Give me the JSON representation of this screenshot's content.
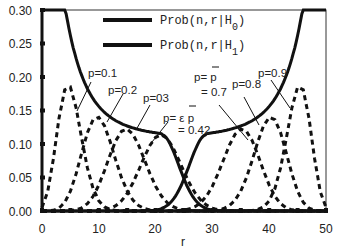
{
  "chart_data": {
    "type": "line",
    "title": "",
    "xlabel": "r",
    "ylabel": "",
    "xlim": [
      0,
      50
    ],
    "ylim": [
      0.0,
      0.3
    ],
    "x_ticks": [
      "0",
      "10",
      "20",
      "30",
      "40",
      "50"
    ],
    "y_ticks": [
      "0.00",
      "0.05",
      "0.10",
      "0.15",
      "0.20",
      "0.25",
      "0.30"
    ],
    "grid": false,
    "legend_position": "top-center",
    "legend": [
      {
        "label": "Prob(n,r|H",
        "subscript": "0",
        "close": ")",
        "style": "solid"
      },
      {
        "label": "Prob(n,r|H",
        "subscript": "1",
        "close": ")",
        "style": "solid"
      }
    ],
    "n": 50,
    "series": [
      {
        "name": "Prob(n,r|H0)",
        "style": "solid",
        "description": "envelope decreasing from >0.30 at r~2 to ~0.11 at r~21, then to 0 near r~30"
      },
      {
        "name": "Prob(n,r|H1)",
        "style": "solid",
        "description": "mirror envelope rising from 0 near r~20 to ~0.11 at r~29, then to >0.30 at r~48"
      },
      {
        "name": "p=0.1",
        "style": "dashed",
        "peak_r": 5,
        "peak_value": 0.185
      },
      {
        "name": "p=0.2",
        "style": "dashed",
        "peak_r": 10,
        "peak_value": 0.14
      },
      {
        "name": "p=0.3",
        "style": "dashed",
        "peak_r": 15,
        "peak_value": 0.122
      },
      {
        "name": "p=0.42",
        "style": "dashed",
        "peak_r": 21,
        "peak_value": 0.114
      },
      {
        "name": "p=0.7",
        "style": "dashed",
        "peak_r": 35,
        "peak_value": 0.122
      },
      {
        "name": "p=0.8",
        "style": "dashed",
        "peak_r": 40,
        "peak_value": 0.14
      },
      {
        "name": "p=0.9",
        "style": "dashed",
        "peak_r": 45,
        "peak_value": 0.185
      }
    ],
    "annotations": [
      "p=0.1",
      "p=0.2",
      "p=03",
      "p=ε p̄",
      "= 0.42",
      "p= p̄",
      "= 0.7",
      "p=0.8",
      "p=0.9"
    ]
  },
  "labels": {
    "xlabel": "r",
    "legend0": "Prob(n,r|H",
    "legend0_sub": "0",
    "legend1": "Prob(n,r|H",
    "legend1_sub": "1",
    "close": ")",
    "a1": "p=0.1",
    "a2": "p=0.2",
    "a3": "p=03",
    "a4a": "p= ε p",
    "a4b": "= 0.42",
    "a5a": "p= p",
    "a5b": "= 0.7",
    "a6": "p=0.8",
    "a7": "p=0.9"
  }
}
